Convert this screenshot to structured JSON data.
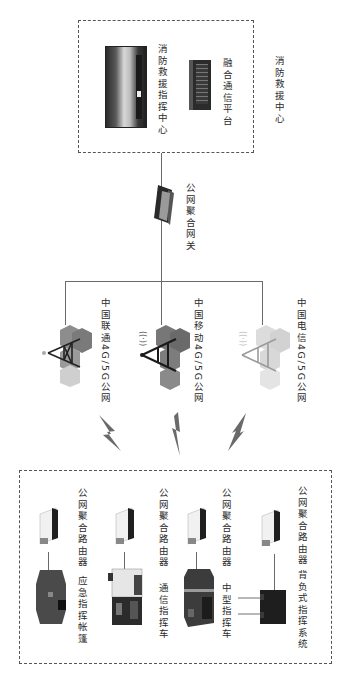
{
  "diagram": {
    "orientation": "rotated 90deg clockwise (text reads top-to-bottom)",
    "top_group": {
      "label": "消防救援中心",
      "items": [
        {
          "label": "消防救援指挥中心",
          "icon": "command-center-photo"
        },
        {
          "label": "融合通信平台",
          "icon": "server-rack"
        }
      ]
    },
    "gateway": {
      "label": "公网聚合网关",
      "icon": "gateway-device"
    },
    "networks": [
      {
        "label": "中国联通4G/5G公网",
        "icon": "cell-tower",
        "color": "#8a8a8a"
      },
      {
        "label": "中国移动4G/5G公网",
        "icon": "cell-tower",
        "color": "#6e6e6e"
      },
      {
        "label": "中国电信4G/5G公网",
        "icon": "cell-tower",
        "color": "#c8c8c8"
      }
    ],
    "wireless_links": 3,
    "bottom_group": {
      "terminals": [
        {
          "label": "应急指挥帐篷",
          "router_label": "公网聚合路由器",
          "icon": "tent"
        },
        {
          "label": "通信指挥车",
          "router_label": "公网聚合路由器",
          "icon": "comm-vehicle"
        },
        {
          "label": "中型指挥车",
          "router_label": "公网聚合路由器",
          "icon": "command-vehicle"
        },
        {
          "label": "背负式指挥系统",
          "router_label": "公网聚合路由器",
          "icon": "backpack-system"
        }
      ]
    }
  }
}
